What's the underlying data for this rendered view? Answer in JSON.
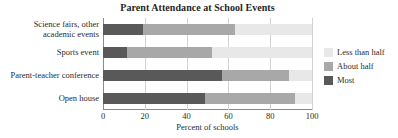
{
  "chart_data": {
    "type": "bar",
    "orientation": "horizontal",
    "stacked": true,
    "title": "Parent Attendance at School Events",
    "xlabel": "Percent of schools",
    "ylabel": "",
    "xlim": [
      0,
      100
    ],
    "xticks": [
      0,
      20,
      40,
      60,
      80,
      100
    ],
    "grid": true,
    "legend_position": "right",
    "categories": [
      "Science fairs, other academic events",
      "Sports event",
      "Parent-teacher conference",
      "Open house"
    ],
    "category_lines": [
      [
        "Science fairs, other",
        "academic events"
      ],
      [
        "Sports event"
      ],
      [
        "Parent-teacher conference"
      ],
      [
        "Open house"
      ]
    ],
    "series": [
      {
        "name": "Most",
        "color": "#595959",
        "values": [
          19,
          11.5,
          57,
          49
        ]
      },
      {
        "name": "About half",
        "color": "#a8a8a8",
        "values": [
          44,
          40.5,
          32,
          43
        ]
      },
      {
        "name": "Less than half",
        "color": "#e8e8e8",
        "values": [
          37,
          48,
          11,
          8
        ]
      }
    ],
    "cumulative_boundaries": [
      [
        19,
        63,
        100
      ],
      [
        11.5,
        52,
        100
      ],
      [
        57,
        89,
        100
      ],
      [
        49,
        92,
        100
      ]
    ],
    "legend_entries": [
      {
        "label": "Less than half",
        "color": "#e8e8e8"
      },
      {
        "label": "About half",
        "color": "#a8a8a8"
      },
      {
        "label": "Most",
        "color": "#595959"
      }
    ],
    "colors": {
      "most": "#595959",
      "about_half": "#a8a8a8",
      "less_than_half": "#e8e8e8",
      "axis": "#8a8a8a",
      "grid": "#d2d2d2",
      "text": "#2b2b2b",
      "background": "#ffffff"
    }
  }
}
